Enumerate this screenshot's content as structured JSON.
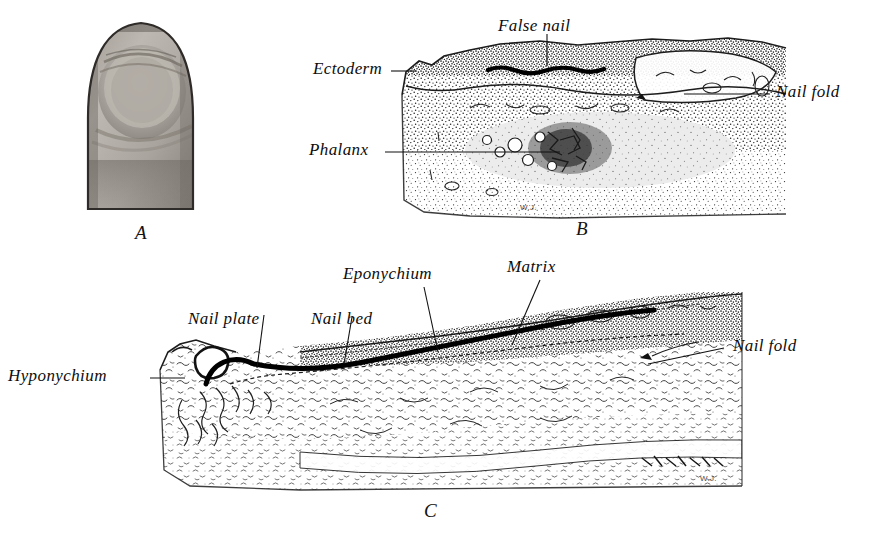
{
  "plate": {
    "title": "Development and structure of the human nail",
    "background_color": "#ffffff",
    "ink_color": "#111111"
  },
  "figures": [
    {
      "id": "A",
      "letter": "A",
      "kind": "halftone-photograph",
      "caption": "Photograph of fingertip showing nail",
      "signature": ""
    },
    {
      "id": "B",
      "letter": "B",
      "kind": "line-drawing-section",
      "caption": "Sagittal section of embryonic digit showing false nail",
      "signature": "W.J."
    },
    {
      "id": "C",
      "letter": "C",
      "kind": "line-drawing-section",
      "caption": "Sagittal section of mature nail and nail bed",
      "signature": "W.J."
    }
  ],
  "labels_b": [
    {
      "text": "False nail",
      "id": "false-nail"
    },
    {
      "text": "Ectoderm",
      "id": "ectoderm"
    },
    {
      "text": "Nail fold",
      "id": "nail-fold-b"
    },
    {
      "text": "Phalanx",
      "id": "phalanx"
    }
  ],
  "labels_c": [
    {
      "text": "Eponychium",
      "id": "eponychium"
    },
    {
      "text": "Matrix",
      "id": "matrix"
    },
    {
      "text": "Nail plate",
      "id": "nail-plate"
    },
    {
      "text": "Nail bed",
      "id": "nail-bed"
    },
    {
      "text": "Hyponychium",
      "id": "hyponychium"
    },
    {
      "text": "Nail fold",
      "id": "nail-fold-c"
    }
  ],
  "signatures": {
    "figure_b": "W.J.",
    "figure_c": "W.J."
  },
  "figure_letters": {
    "a": "A",
    "b": "B",
    "c": "C"
  }
}
